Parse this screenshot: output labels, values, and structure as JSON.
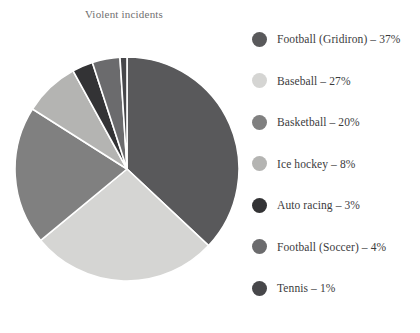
{
  "chart_data": {
    "type": "pie",
    "title": "Violent incidents",
    "xlabel": "",
    "ylabel": "",
    "legend_position": "right",
    "grid": false,
    "unit": "%",
    "start_angle_deg": 0,
    "direction": "clockwise",
    "categories": [
      "Football (Gridiron)",
      "Baseball",
      "Basketball",
      "Ice hockey",
      "Auto racing",
      "Football (Soccer)",
      "Tennis"
    ],
    "values": [
      37,
      27,
      20,
      8,
      3,
      4,
      1
    ],
    "colors": [
      "#59595b",
      "#d5d5d3",
      "#808080",
      "#b4b4b2",
      "#333335",
      "#6b6b6d",
      "#47474a"
    ],
    "slice_separator_color": "#ffffff",
    "slices": [
      {
        "label": "Football (Gridiron)",
        "value": 37,
        "legend_text": "Football (Gridiron) – 37%",
        "color": "#59595b"
      },
      {
        "label": "Baseball",
        "value": 27,
        "legend_text": "Baseball – 27%",
        "color": "#d5d5d3"
      },
      {
        "label": "Basketball",
        "value": 20,
        "legend_text": "Basketball – 20%",
        "color": "#808080"
      },
      {
        "label": "Ice hockey",
        "value": 8,
        "legend_text": "Ice hockey – 8%",
        "color": "#b4b4b2"
      },
      {
        "label": "Auto racing",
        "value": 3,
        "legend_text": "Auto racing – 3%",
        "color": "#333335"
      },
      {
        "label": "Football (Soccer)",
        "value": 4,
        "legend_text": "Football (Soccer) – 4%",
        "color": "#6b6b6d"
      },
      {
        "label": "Tennis",
        "value": 1,
        "legend_text": "Tennis – 1%",
        "color": "#47474a"
      }
    ]
  },
  "legend": {
    "items": [
      {
        "text": "Football (Gridiron) – 37%",
        "color": "#59595b"
      },
      {
        "text": "Baseball – 27%",
        "color": "#d5d5d3"
      },
      {
        "text": "Basketball – 20%",
        "color": "#808080"
      },
      {
        "text": "Ice hockey – 8%",
        "color": "#b4b4b2"
      },
      {
        "text": "Auto racing – 3%",
        "color": "#333335"
      },
      {
        "text": "Football (Soccer) – 4%",
        "color": "#6b6b6d"
      },
      {
        "text": "Tennis – 1%",
        "color": "#47474a"
      }
    ]
  }
}
